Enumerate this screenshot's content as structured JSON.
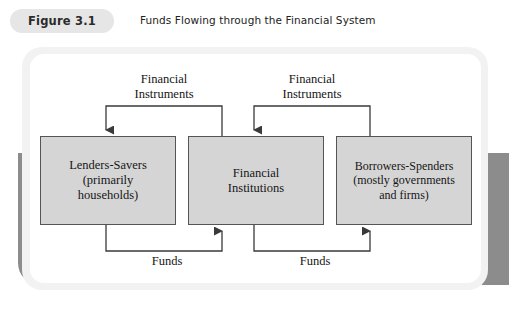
{
  "figure": {
    "number_label": "Figure 3.1",
    "title": "Funds Flowing through the Financial System"
  },
  "diagram": {
    "type": "flow-diagram",
    "nodes": [
      {
        "id": "lenders",
        "label": "Lenders-Savers\n(primarily\nhouseholds)",
        "line1": "Lenders-Savers",
        "line2": "(primarily",
        "line3": "households)"
      },
      {
        "id": "institutions",
        "label": "Financial\nInstitutions",
        "line1": "Financial",
        "line2": "Institutions",
        "line3": ""
      },
      {
        "id": "borrowers",
        "label": "Borrowers-Spenders\n(mostly governments\nand firms)",
        "line1": "Borrowers-Spenders",
        "line2": "(mostly governments",
        "line3": "and firms)"
      }
    ],
    "flow_labels": {
      "instruments_left": "Financial\nInstruments",
      "instruments_left_line1": "Financial",
      "instruments_left_line2": "Instruments",
      "instruments_right": "Financial\nInstruments",
      "instruments_right_line1": "Financial",
      "instruments_right_line2": "Instruments",
      "funds_left": "Funds",
      "funds_right": "Funds"
    },
    "edges": [
      {
        "from": "institutions",
        "to": "lenders",
        "label": "Financial Instruments",
        "direction": "right-to-left",
        "position": "top"
      },
      {
        "from": "borrowers",
        "to": "institutions",
        "label": "Financial Instruments",
        "direction": "right-to-left",
        "position": "top"
      },
      {
        "from": "lenders",
        "to": "institutions",
        "label": "Funds",
        "direction": "left-to-right",
        "position": "bottom"
      },
      {
        "from": "institutions",
        "to": "borrowers",
        "label": "Funds",
        "direction": "left-to-right",
        "position": "bottom"
      }
    ]
  },
  "colors": {
    "pill_background": "#e6e6e6",
    "box_fill": "#d5d5d5",
    "box_border": "#555555",
    "frame_fill": "#ffffff",
    "frame_edge": "#f2f2f2",
    "shadow_band": "#8c8c8c",
    "line": "#3a3a3a",
    "text": "#151515"
  }
}
